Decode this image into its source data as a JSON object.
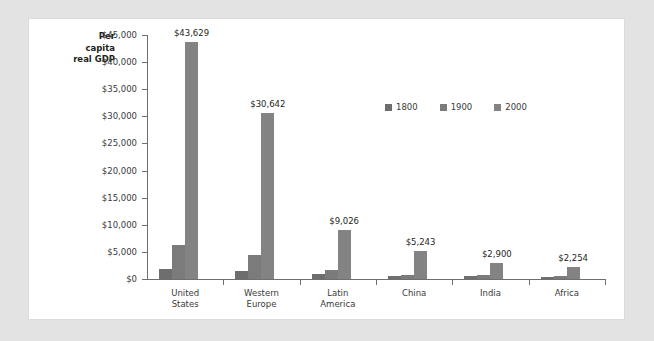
{
  "panel": {
    "background": "#ffffff",
    "page_background": "#e3e3e3"
  },
  "chart_data": {
    "type": "bar",
    "title": "",
    "ylabel_lines": [
      "Per",
      "capita",
      "real GDP"
    ],
    "ylabel": "Per capita real GDP",
    "xlabel": "",
    "ylim": [
      0,
      45000
    ],
    "grid": false,
    "legend_position": "inside-top-center",
    "ytick_labels": [
      "$45,000",
      "$40,000",
      "$35,000",
      "$30,000",
      "$25,000",
      "$20,000",
      "$15,000",
      "$10,000",
      "$5,000",
      "$0"
    ],
    "ytick_values": [
      45000,
      40000,
      35000,
      30000,
      25000,
      20000,
      15000,
      10000,
      5000,
      0
    ],
    "categories": [
      "United States",
      "Western Europe",
      "Latin America",
      "China",
      "India",
      "Africa"
    ],
    "category_lines": [
      [
        "United",
        "States"
      ],
      [
        "Western",
        "Europe"
      ],
      [
        "Latin",
        "America"
      ],
      [
        "China"
      ],
      [
        "India"
      ],
      [
        "Africa"
      ]
    ],
    "series": [
      {
        "name": "1800",
        "color": "#6e6e6e",
        "values": [
          1800,
          1500,
          1000,
          600,
          550,
          450
        ]
      },
      {
        "name": "1900",
        "color": "#7b7b7b",
        "values": [
          6200,
          4500,
          1700,
          700,
          650,
          600
        ]
      },
      {
        "name": "2000",
        "color": "#838383",
        "values": [
          43629,
          30642,
          9026,
          5243,
          2900,
          2254
        ]
      }
    ],
    "data_labels": [
      "$43,629",
      "$30,642",
      "$9,026",
      "$5,243",
      "$2,900",
      "$2,254"
    ],
    "data_label_series": "2000"
  },
  "legend": {
    "items": [
      {
        "label": "1800",
        "color": "#6e6e6e"
      },
      {
        "label": "1900",
        "color": "#7b7b7b"
      },
      {
        "label": "2000",
        "color": "#838383"
      }
    ]
  }
}
